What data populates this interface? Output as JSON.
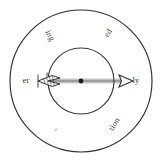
{
  "figure": {
    "background_color": "#ffffff",
    "stroke_color": "#2e2e2e",
    "text_color": "#3c3c3c",
    "faint_text_color": "#8c8c8c"
  },
  "geometry": {
    "center_x": 81,
    "center_y": 81,
    "outer_radius": 71,
    "inner_radius": 33,
    "arrow_tip_x": 133,
    "arrow_tail_x": 38
  },
  "arrow": {
    "name": "arrow",
    "direction": "rightward",
    "head_style": "hollow-triangle",
    "tail_style": "hatched-fletching",
    "center_marker": "filled-dot"
  },
  "labels": {
    "outer_ring": [
      {
        "id": "ing",
        "text": "ing",
        "angle_deg": 235,
        "rotation_deg": 62,
        "faint": false
      },
      {
        "id": "ed",
        "text": "ed",
        "angle_deg": 300,
        "rotation_deg": -58,
        "faint": false
      },
      {
        "id": "ly",
        "text": "ly",
        "angle_deg": 0,
        "rotation_deg": 0,
        "faint": false
      },
      {
        "id": "tion",
        "text": "tion",
        "angle_deg": 52,
        "rotation_deg": -60,
        "faint": false
      },
      {
        "id": "s",
        "text": "s",
        "angle_deg": 117,
        "rotation_deg": 62,
        "faint": true
      },
      {
        "id": "er",
        "text": "er",
        "angle_deg": 180,
        "rotation_deg": 0,
        "faint": false
      }
    ]
  }
}
